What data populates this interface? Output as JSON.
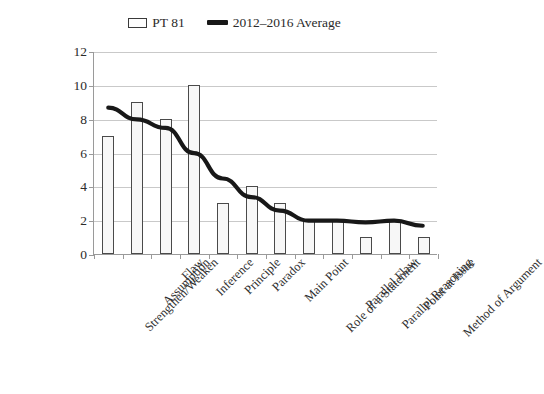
{
  "legend": {
    "bar_series_label": "PT 81",
    "line_series_label": "2012–2016 Average",
    "bar_swatch_icon": "bar-swatch-icon",
    "line_swatch_icon": "line-swatch-icon"
  },
  "axis": {
    "y_ticks": [
      0,
      2,
      4,
      6,
      8,
      10,
      12
    ],
    "y_min": 0,
    "y_max": 12
  },
  "colors": {
    "bar_fill": "#f7f7f7",
    "bar_outline": "#4a4a4a",
    "line": "#181818",
    "gridline": "#c9c9c9",
    "axis": "#9a9a9a",
    "text": "#2b2b2b",
    "background": "#ffffff"
  },
  "chart_data": {
    "type": "bar",
    "title": "",
    "subtitle": "",
    "xlabel": "",
    "ylabel": "",
    "ylim": [
      0,
      12
    ],
    "ytick_step": 2,
    "grid": true,
    "legend_position": "top-center",
    "categories": [
      "Strengthen/Weaken",
      "Assumption",
      "Flaw",
      "Inference",
      "Principle",
      "Paradox",
      "Main Point",
      "Role of a Statement",
      "Parallel Flaw",
      "Parallel Reasoning",
      "Point at Issue",
      "Method of Argument"
    ],
    "series": [
      {
        "name": "PT 81",
        "type": "bar",
        "values": [
          7,
          9,
          8,
          10,
          3,
          4,
          3,
          2,
          2,
          1,
          2,
          1
        ]
      },
      {
        "name": "2012–2016 Average",
        "type": "line",
        "values": [
          8.7,
          8.0,
          7.5,
          6.0,
          4.5,
          3.4,
          2.6,
          2.0,
          2.0,
          1.9,
          2.0,
          1.7
        ]
      }
    ]
  }
}
